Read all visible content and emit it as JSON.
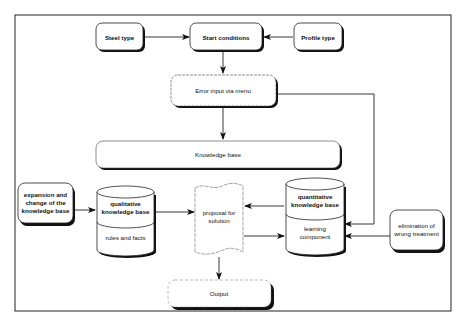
{
  "diagram": {
    "nodes": {
      "steel_type": {
        "label": "Steel type"
      },
      "start_conditions": {
        "label": "Start conditions"
      },
      "profile_type": {
        "label": "Profile type"
      },
      "error_input": {
        "label": "Error input via menu"
      },
      "knowledge_base": {
        "label": "Knowledge base"
      },
      "expansion": {
        "lines": [
          "expansion and",
          "change of the",
          "knowledge base"
        ]
      },
      "qualitative_kb": {
        "top_lines": [
          "qualitative",
          "knowledge base"
        ],
        "bottom_label": "rules and facts"
      },
      "proposal": {
        "lines": [
          "proposal for",
          "solution"
        ]
      },
      "quantitative_kb": {
        "top_lines": [
          "quantitative",
          "knowledge base"
        ],
        "bottom_lines": [
          "learning",
          "component"
        ]
      },
      "elimination": {
        "lines": [
          "elimination of",
          "wrong treatment"
        ]
      },
      "output": {
        "label": "Output"
      }
    },
    "edges": [
      {
        "from": "Steel type",
        "to": "Start conditions"
      },
      {
        "from": "Profile type",
        "to": "Start conditions"
      },
      {
        "from": "Start conditions",
        "to": "Error input via menu"
      },
      {
        "from": "Error input via menu",
        "to": "Knowledge base"
      },
      {
        "from": "Error input via menu",
        "to": "learning component"
      },
      {
        "from": "expansion and change of the knowledge base",
        "to": "qualitative knowledge base"
      },
      {
        "from": "qualitative knowledge base",
        "to": "proposal for solution"
      },
      {
        "from": "quantitative knowledge base",
        "to": "proposal for solution"
      },
      {
        "from": "proposal for solution",
        "to": "learning component"
      },
      {
        "from": "elimination of wrong treatment",
        "to": "learning component"
      },
      {
        "from": "proposal for solution",
        "to": "Output"
      }
    ]
  }
}
